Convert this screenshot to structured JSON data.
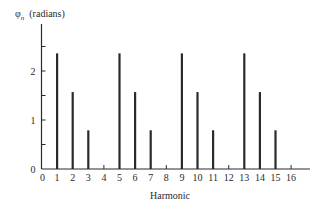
{
  "chart_data": {
    "type": "bar",
    "style": "stem",
    "title": "",
    "xlabel": "Harmonic",
    "ylabel": "φn (radians)",
    "ylabel_symbol": "φ",
    "ylabel_subscript": "n",
    "ylabel_unit": "(radians)",
    "categories": [
      0,
      1,
      2,
      3,
      4,
      5,
      6,
      7,
      8,
      9,
      10,
      11,
      12,
      13,
      14,
      15,
      16
    ],
    "x_tick_labels": [
      "0",
      "1",
      "2",
      "3",
      "4",
      "5",
      "6",
      "7",
      "8",
      "9",
      "10",
      "11",
      "12",
      "13",
      "14",
      "15",
      "16"
    ],
    "values": [
      0,
      2.36,
      1.57,
      0.79,
      0,
      2.36,
      1.57,
      0.79,
      0,
      2.36,
      1.57,
      0.79,
      0,
      2.36,
      1.57,
      0.79,
      0
    ],
    "y_tick_values": [
      0,
      0.5,
      1,
      1.5,
      2,
      2.5
    ],
    "y_tick_labels": [
      "0",
      "",
      "1",
      "",
      "2",
      ""
    ],
    "ylim": [
      0,
      2.9
    ],
    "xlim": [
      0,
      17.2
    ],
    "grid": false,
    "legend": null,
    "bar_color": "#2a2a2a"
  }
}
